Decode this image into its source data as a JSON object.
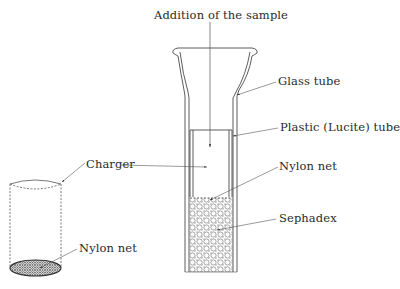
{
  "diagram": {
    "labels": {
      "addition": "Addition of the sample",
      "glass_tube": "Glass tube",
      "plastic_tube": "Plastic (Lucite) tube",
      "charger": "Charger",
      "nylon_net_column": "Nylon net",
      "sephadex": "Sephadex",
      "nylon_net_charger": "Nylon net"
    },
    "colors": {
      "line": "#4a4a4a",
      "text": "#2a2a2a",
      "background": "#ffffff"
    }
  }
}
